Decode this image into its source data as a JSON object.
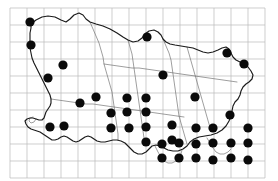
{
  "figure": {
    "name": "distribution-dot-map",
    "type": "dot-distribution-map",
    "width": 278,
    "height": 181,
    "background_color": "#ffffff"
  },
  "grid": {
    "name": "reference-grid",
    "origin_x": 10,
    "origin_y": 8,
    "cell_size": 17,
    "columns": 15,
    "rows": 10,
    "line_color": "#b9b9b9",
    "line_width": 0.7,
    "labels_shown": false,
    "x_positions": [
      10,
      27,
      44,
      61,
      78,
      95,
      112,
      129,
      146,
      163,
      180,
      197,
      214,
      231,
      248,
      265
    ],
    "y_positions": [
      8,
      25,
      42,
      59,
      76,
      93,
      110,
      127,
      144,
      161,
      178
    ]
  },
  "outline": {
    "name": "territory-coastline",
    "stroke_color": "#1a1a1a",
    "stroke_width": 1.15,
    "fill": "none",
    "path": "M 31 24 L 36 20 L 42 17 L 48 16 L 55 17 L 61 20 L 66 22 L 70 19 L 74 15 L 79 13 L 83 15 L 86 19 L 90 22 L 96 24 L 103 26 L 110 29 L 117 33 L 123 37 L 128 40 L 133 42 L 138 41 L 142 38 L 145 34 L 149 31 L 154 30 L 158 32 L 161 35 L 163 39 L 166 42 L 170 44 L 175 45 L 181 46 L 187 47 L 193 48 L 198 50 L 203 52 L 208 53 L 213 52 L 218 50 L 222 48 L 226 47 L 229 49 L 231 53 L 233 57 L 236 60 L 240 62 L 244 64 L 248 67 L 251 71 L 253 75 L 252 79 L 249 82 L 246 84 L 243 87 L 241 91 L 240 95 L 238 99 L 235 102 L 233 106 L 232 111 L 231 116 L 229 121 L 226 126 L 222 130 L 217 133 L 211 135 L 205 136 L 199 137 L 194 139 L 190 142 L 187 146 L 183 149 L 178 151 L 173 151 L 168 150 L 164 148 L 160 146 L 156 145 L 152 146 L 149 149 L 146 152 L 142 154 L 138 154 L 134 152 L 131 149 L 128 146 L 125 143 L 121 141 L 117 140 L 113 140 L 109 141 L 105 142 L 101 142 L 97 141 L 94 139 L 91 137 L 88 136 L 85 137 L 82 139 L 79 141 L 76 142 L 73 141 L 70 139 L 67 137 L 64 136 L 61 137 L 58 139 L 55 140 L 52 140 L 49 138 L 46 136 L 43 134 L 40 132 L 37 131 L 34 130 L 31 129 L 28 127 L 26 124 L 25 121 L 27 119 L 30 118 L 33 118 L 36 119 L 39 120 L 42 120 L 44 118 L 45 115 L 46 112 L 48 109 L 50 106 L 51 103 L 51 99 L 50 95 L 48 91 L 46 87 L 44 83 L 42 79 L 40 75 L 38 71 L 36 67 L 34 63 L 32 58 L 31 53 L 30 48 L 30 43 L 30 38 L 30 33 L 31 28 Z",
    "inner_paths": [
      "M 90 22 L 93 29 L 96 36 L 99 43 L 101 50 L 103 57 L 104 64 L 106 71 L 108 78 L 110 85 L 112 92 L 113 99 L 114 106 L 115 113 L 116 120 L 117 127 L 118 134 L 118 140",
      "M 128 40 L 130 47 L 132 54 L 133 61 L 134 68 L 135 75 L 136 82 L 137 89 L 138 96 L 139 103 L 140 110 L 141 117 L 142 124 L 143 131 L 144 138 L 145 145",
      "M 163 39 L 166 46 L 169 53 L 171 60 L 172 67 L 173 74 L 174 81 L 175 88 L 176 95 L 177 102 L 178 109 L 179 116 L 181 123 L 183 130 L 185 137 L 187 144",
      "M 104 64 L 111 65 L 118 66 L 125 67 L 132 68 L 139 68 L 146 69 L 153 70 L 160 71 L 167 72 L 174 73 L 181 74 L 188 75 L 195 76 L 202 77 L 209 78 L 216 79 L 223 80 L 230 81 L 237 82",
      "M 51 99 L 58 100 L 65 101 L 72 102 L 79 103 L 86 104 L 93 104 L 100 105 L 107 106 L 114 107 L 121 108 L 128 109 L 135 110 L 142 111 L 149 112 L 156 113 L 163 114 L 170 115 L 177 116 L 184 117",
      "M 187 47 L 189 54 L 191 61 L 193 68 L 195 75 L 197 82 L 199 89 L 201 96 L 203 103 L 205 110 L 207 117 L 209 124 L 211 131",
      "M 36 119 L 34 122 L 31 123 L 29 121 L 30 118 L 33 117",
      "M 155 146 L 158 152 L 161 157 L 164 161 L 168 163 L 172 163 L 176 161 L 179 158 L 181 154 L 182 150",
      "M 207 138 L 210 143 L 213 148 L 216 152 L 220 154 L 224 154 L 228 152 L 231 149"
    ]
  },
  "regions": {
    "name": "internal-region-boundaries",
    "stroke_color": "#6a6a6a",
    "stroke_width": 0.65
  },
  "dots": {
    "name": "occurrence-records",
    "symbol": "filled-circle",
    "color": "#0a0a0a",
    "radius": 4.6,
    "count": 40,
    "points": [
      {
        "x": 30,
        "y": 22
      },
      {
        "x": 31,
        "y": 45
      },
      {
        "x": 48,
        "y": 78
      },
      {
        "x": 63,
        "y": 65
      },
      {
        "x": 50,
        "y": 127
      },
      {
        "x": 64,
        "y": 126
      },
      {
        "x": 80,
        "y": 103
      },
      {
        "x": 96,
        "y": 97
      },
      {
        "x": 147,
        "y": 37
      },
      {
        "x": 163,
        "y": 75
      },
      {
        "x": 227,
        "y": 53
      },
      {
        "x": 244,
        "y": 64
      },
      {
        "x": 127,
        "y": 98
      },
      {
        "x": 146,
        "y": 98
      },
      {
        "x": 127,
        "y": 112
      },
      {
        "x": 146,
        "y": 112
      },
      {
        "x": 111,
        "y": 113
      },
      {
        "x": 146,
        "y": 127
      },
      {
        "x": 129,
        "y": 128
      },
      {
        "x": 111,
        "y": 128
      },
      {
        "x": 146,
        "y": 142
      },
      {
        "x": 172,
        "y": 125
      },
      {
        "x": 172,
        "y": 140
      },
      {
        "x": 230,
        "y": 115
      },
      {
        "x": 195,
        "y": 97
      },
      {
        "x": 179,
        "y": 143
      },
      {
        "x": 196,
        "y": 144
      },
      {
        "x": 213,
        "y": 143
      },
      {
        "x": 231,
        "y": 143
      },
      {
        "x": 248,
        "y": 143
      },
      {
        "x": 196,
        "y": 158
      },
      {
        "x": 213,
        "y": 160
      },
      {
        "x": 231,
        "y": 158
      },
      {
        "x": 248,
        "y": 160
      },
      {
        "x": 179,
        "y": 158
      },
      {
        "x": 162,
        "y": 158
      },
      {
        "x": 162,
        "y": 144
      },
      {
        "x": 213,
        "y": 128
      },
      {
        "x": 196,
        "y": 128
      },
      {
        "x": 248,
        "y": 128
      }
    ]
  }
}
